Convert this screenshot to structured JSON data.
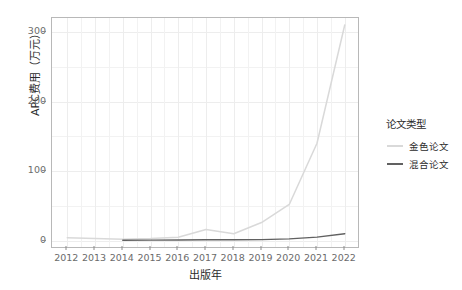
{
  "chart_data": {
    "type": "line",
    "title": "",
    "xlabel": "出版年",
    "ylabel": "APC费用（万元）",
    "x": [
      2012,
      2013,
      2014,
      2015,
      2016,
      2017,
      2018,
      2019,
      2020,
      2021,
      2022
    ],
    "xticklabels": [
      "2012",
      "2013",
      "2014",
      "2015",
      "2016",
      "2017",
      "2018",
      "2019",
      "2020",
      "2021",
      "2022"
    ],
    "yticklabels": [
      "0",
      "100",
      "200",
      "300"
    ],
    "ytickvalues": [
      0,
      100,
      200,
      300
    ],
    "xlim": [
      2011.45,
      2022.55
    ],
    "ylim": [
      -12,
      320
    ],
    "grid": true,
    "legend_position": "right",
    "legend_title": "论文类型",
    "series": [
      {
        "name": "金色论文",
        "color": "#d9d9d9",
        "values": [
          4,
          3,
          2,
          3,
          5,
          16,
          10,
          26,
          52,
          140,
          310
        ]
      },
      {
        "name": "混合论文",
        "color": "#616161",
        "values": [
          null,
          null,
          0.5,
          0.8,
          1.0,
          1.2,
          1.3,
          1.5,
          2.5,
          5,
          10
        ]
      }
    ]
  },
  "axes": {
    "y_title": "APC费用（万元）",
    "x_title": "出版年"
  },
  "legend": {
    "title": "论文类型",
    "items": [
      {
        "label": "金色论文",
        "color": "#d9d9d9"
      },
      {
        "label": "混合论文",
        "color": "#616161"
      }
    ]
  },
  "colors": {
    "panel_bg": "#ffffff",
    "grid": "#f0f0f0",
    "axis_text": "#6b6b6b",
    "title_text": "#2b2b2b",
    "border": "#b8b8b8"
  }
}
